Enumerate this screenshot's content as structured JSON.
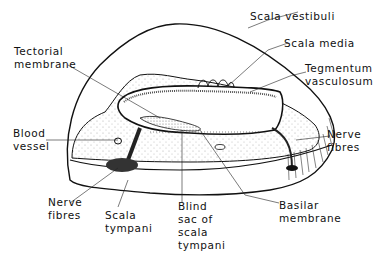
{
  "diagram": {
    "labels": {
      "scala_vestibuli": "Scala vestibuli",
      "scala_media": "Scala media",
      "tegmentum_line1": "Tegmentum",
      "tegmentum_line2": "vasculosum",
      "tectorial_line1": "Tectorial",
      "tectorial_line2": "membrane",
      "blood_line1": "Blood",
      "blood_line2": "vessel",
      "nerve_right_line1": "Nerve",
      "nerve_right_line2": "fibres",
      "nerve_left_line1": "Nerve",
      "nerve_left_line2": "fibres",
      "scala_tympani_line1": "Scala",
      "scala_tympani_line2": "tympani",
      "blind_line1": "Blind",
      "blind_line2": "sac of",
      "blind_line3": "scala",
      "blind_line4": "tympani",
      "basilar_line1": "Basilar",
      "basilar_line2": "membrane"
    },
    "colors": {
      "stroke": "#111111",
      "background": "#ffffff",
      "stipple": "#9a9a9a"
    }
  }
}
